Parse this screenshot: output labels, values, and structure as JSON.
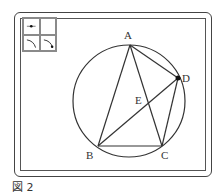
{
  "caption": "図 2",
  "toolbar": {
    "tools": [
      {
        "name": "point-tool"
      },
      {
        "name": "select-tool"
      },
      {
        "name": "arc-tool"
      },
      {
        "name": "arc-point-tool"
      }
    ]
  },
  "figure": {
    "circle": {
      "cx": 129,
      "cy": 101,
      "r": 56
    },
    "points": {
      "A": {
        "label": "A",
        "x": 130,
        "y": 45
      },
      "B": {
        "label": "B",
        "x": 98,
        "y": 146
      },
      "C": {
        "label": "C",
        "x": 162,
        "y": 146
      },
      "D": {
        "label": "D",
        "x": 178,
        "y": 78
      },
      "E": {
        "label": "E",
        "x": 147,
        "y": 105
      }
    },
    "segments": [
      "AB",
      "AC",
      "AD",
      "BC",
      "BD",
      "CD"
    ],
    "colors": {
      "stroke": "#333333",
      "toolbar_bg": "#8a8a8a"
    }
  }
}
